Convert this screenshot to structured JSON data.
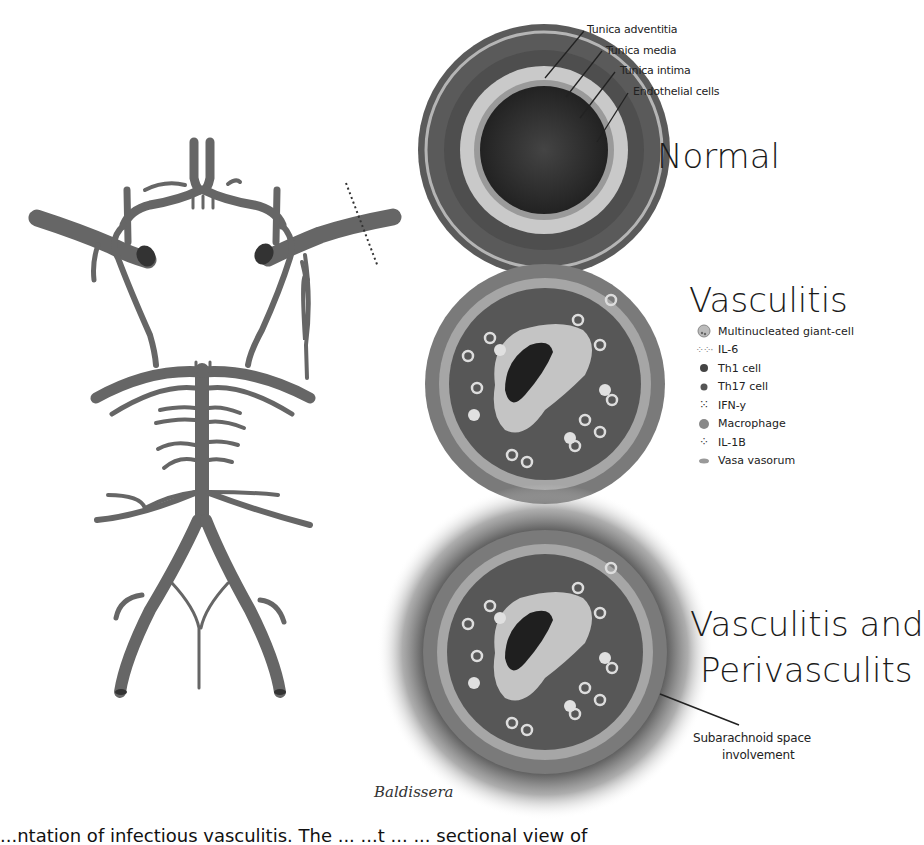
{
  "figure": {
    "normal": {
      "title": "Normal",
      "labels": [
        {
          "text": "Tunica adventitia"
        },
        {
          "text": "Tunica media"
        },
        {
          "text": "Tunica intima"
        },
        {
          "text": "Endothelial cells"
        }
      ]
    },
    "vasculitis": {
      "title": "Vasculitis",
      "legend": [
        {
          "label": "Multinucleated giant-cell",
          "icon": "giant-cell-icon"
        },
        {
          "label": "IL-6",
          "icon": "il6-dots-icon"
        },
        {
          "label": "Th1 cell",
          "icon": "th1-cell-icon"
        },
        {
          "label": "Th17 cell",
          "icon": "th17-cell-icon"
        },
        {
          "label": "IFN-y",
          "icon": "ifn-dots-icon"
        },
        {
          "label": "Macrophage",
          "icon": "macrophage-icon"
        },
        {
          "label": "IL-1B",
          "icon": "il1b-dots-icon"
        },
        {
          "label": "Vasa vasorum",
          "icon": "vasa-vasorum-icon"
        }
      ]
    },
    "perivasculitis": {
      "title_line1": "Vasculitis and",
      "title_line2": "Perivasculits",
      "annotation_line1": "Subarachnoid space",
      "annotation_line2": "involvement"
    },
    "signature": "Baldissera",
    "caption_fragment": "...ntation of infectious vasculitis. The ...           ...t ...     ... sectional view of"
  },
  "colors": {
    "vessel": "#6b6b6b",
    "vessel_dark": "#4a4a4a",
    "wall_dark": "#555555",
    "intima_light": "#c8c8c8",
    "lumen": "#3a3a3a",
    "background": "#ffffff"
  }
}
